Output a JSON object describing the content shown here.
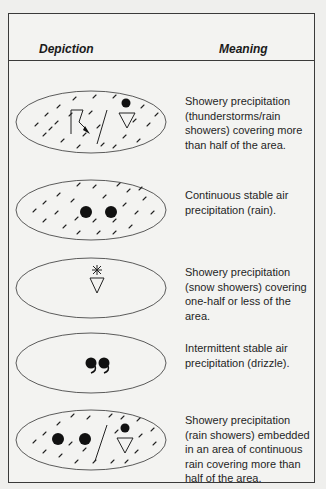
{
  "table": {
    "headers": {
      "depiction": "Depiction",
      "meaning": "Meaning"
    },
    "rows": [
      {
        "depiction": "oval-hatched-thunderstorm-rainshower",
        "symbols": [
          "hatching",
          "lightning-arrow-icon",
          "slash-divider",
          "dot-over-triangle-icon"
        ],
        "meaning": "Showery precipitation (thunderstorms/rain showers) covering more than half of the area."
      },
      {
        "depiction": "oval-hatched-two-dots",
        "symbols": [
          "hatching",
          "rain-dot-icon",
          "rain-dot-icon"
        ],
        "meaning": "Continuous stable air precipitation (rain)."
      },
      {
        "depiction": "oval-snow-shower",
        "symbols": [
          "asterisk-over-triangle-icon"
        ],
        "meaning": "Showery precipitation (snow showers) covering one-half or less of the area."
      },
      {
        "depiction": "oval-drizzle",
        "symbols": [
          "drizzle-comma-icon",
          "drizzle-comma-icon"
        ],
        "meaning": "Intermittent stable air precipitation (drizzle)."
      },
      {
        "depiction": "oval-hatched-rain-with-showers",
        "symbols": [
          "hatching",
          "rain-dot-icon",
          "rain-dot-icon",
          "slash-divider",
          "dot-over-triangle-icon"
        ],
        "meaning": "Showery precipitation (rain showers) embedded in an area of continuous rain covering more than half of the area."
      }
    ]
  },
  "colors": {
    "background": "#efefed",
    "ink": "#1a1a1a",
    "border": "#3a3a3a"
  }
}
